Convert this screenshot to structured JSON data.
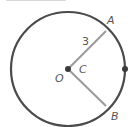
{
  "diagram": {
    "title_cropped": "",
    "circle": {
      "cx": 68,
      "cy": 69,
      "r": 57,
      "stroke": "#4a4a4a"
    },
    "radius_color": "#9a9a9a",
    "points": {
      "O": {
        "label": "O",
        "x": 68,
        "y": 69
      },
      "A": {
        "label": "A",
        "x": 106,
        "y": 31
      },
      "B": {
        "label": "B",
        "x": 106,
        "y": 106
      },
      "right_point": {
        "x": 125,
        "y": 69
      }
    },
    "labels": {
      "radius_length": "3",
      "angle": "C",
      "center": "O",
      "point_a": "A",
      "point_b": "B"
    },
    "colors": {
      "circle": "#4a4a4a",
      "radius": "#9a9a9a",
      "dot": "#3a3a3a",
      "text": "#555555"
    }
  }
}
